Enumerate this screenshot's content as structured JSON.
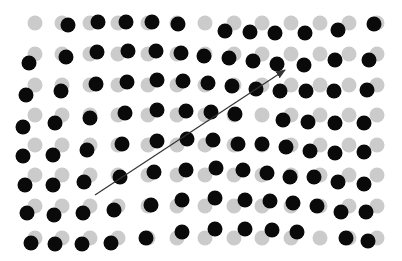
{
  "figure": {
    "width": 402,
    "height": 261,
    "colors": {
      "reference_lattice": "#cbcbcb",
      "displaced_particles": "#0a0a0a",
      "arrow": "#333333",
      "background": "#ffffff"
    },
    "dot_radius": 7.5,
    "reference_lattice": {
      "columns_x": [
        35,
        62,
        90,
        118,
        148,
        177,
        205,
        234,
        262,
        291,
        320,
        349,
        377
      ],
      "rows_y": [
        23,
        54,
        85,
        115,
        145,
        175,
        206,
        238
      ]
    },
    "displaced_particles": [
      [
        68,
        25
      ],
      [
        98,
        22
      ],
      [
        126,
        22
      ],
      [
        152,
        22
      ],
      [
        178,
        24
      ],
      [
        225,
        31
      ],
      [
        250,
        32
      ],
      [
        275,
        33
      ],
      [
        305,
        33
      ],
      [
        338,
        30
      ],
      [
        374,
        24
      ],
      [
        29,
        63
      ],
      [
        66,
        57
      ],
      [
        97,
        52
      ],
      [
        128,
        51
      ],
      [
        156,
        51
      ],
      [
        181,
        53
      ],
      [
        204,
        56
      ],
      [
        229,
        58
      ],
      [
        253,
        61
      ],
      [
        277,
        64
      ],
      [
        304,
        65
      ],
      [
        335,
        60
      ],
      [
        369,
        60
      ],
      [
        26,
        95
      ],
      [
        61,
        91
      ],
      [
        96,
        84
      ],
      [
        127,
        82
      ],
      [
        157,
        80
      ],
      [
        183,
        81
      ],
      [
        208,
        83
      ],
      [
        232,
        86
      ],
      [
        256,
        89
      ],
      [
        280,
        91
      ],
      [
        306,
        91
      ],
      [
        334,
        91
      ],
      [
        367,
        90
      ],
      [
        23,
        127
      ],
      [
        55,
        123
      ],
      [
        90,
        118
      ],
      [
        125,
        113
      ],
      [
        157,
        110
      ],
      [
        186,
        111
      ],
      [
        211,
        112
      ],
      [
        235,
        114
      ],
      [
        283,
        120
      ],
      [
        308,
        122
      ],
      [
        335,
        123
      ],
      [
        364,
        123
      ],
      [
        23,
        156
      ],
      [
        53,
        155
      ],
      [
        87,
        150
      ],
      [
        122,
        144
      ],
      [
        157,
        141
      ],
      [
        187,
        139
      ],
      [
        213,
        140
      ],
      [
        238,
        144
      ],
      [
        262,
        144
      ],
      [
        286,
        147
      ],
      [
        310,
        151
      ],
      [
        335,
        153
      ],
      [
        364,
        152
      ],
      [
        25,
        185
      ],
      [
        53,
        185
      ],
      [
        84,
        182
      ],
      [
        120,
        177
      ],
      [
        154,
        172
      ],
      [
        186,
        170
      ],
      [
        216,
        168
      ],
      [
        243,
        170
      ],
      [
        267,
        173
      ],
      [
        290,
        177
      ],
      [
        314,
        177
      ],
      [
        338,
        182
      ],
      [
        364,
        184
      ],
      [
        27,
        213
      ],
      [
        54,
        215
      ],
      [
        83,
        213
      ],
      [
        114,
        210
      ],
      [
        151,
        205
      ],
      [
        182,
        200
      ],
      [
        215,
        198
      ],
      [
        245,
        200
      ],
      [
        270,
        201
      ],
      [
        293,
        203
      ],
      [
        317,
        206
      ],
      [
        341,
        212
      ],
      [
        366,
        212
      ],
      [
        31,
        243
      ],
      [
        55,
        244
      ],
      [
        82,
        244
      ],
      [
        111,
        243
      ],
      [
        146,
        238
      ],
      [
        182,
        232
      ],
      [
        215,
        229
      ],
      [
        245,
        229
      ],
      [
        272,
        230
      ],
      [
        297,
        232
      ],
      [
        346,
        238
      ],
      [
        368,
        241
      ]
    ],
    "arrow": {
      "x1": 95,
      "y1": 195,
      "x2": 285,
      "y2": 70,
      "stroke_width": 1.2,
      "head": "filled-triangle"
    }
  }
}
